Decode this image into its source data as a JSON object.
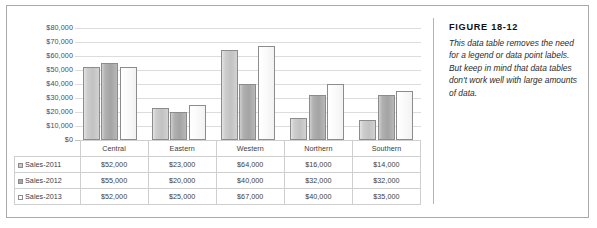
{
  "caption": {
    "figure_number": "FIGURE 18-12",
    "text": "This data table removes the need for a legend or data point labels. But keep in mind that data tables don't work well with large amounts of data."
  },
  "chart_data": {
    "type": "bar",
    "title": "",
    "xlabel": "",
    "ylabel": "",
    "grid": true,
    "legend_position": "data-table",
    "ylim": [
      0,
      80000
    ],
    "ytick_labels": [
      "$80,000",
      "$70,000",
      "$60,000",
      "$50,000",
      "$40,000",
      "$30,000",
      "$20,000",
      "$10,000",
      "$0"
    ],
    "ytick_values": [
      80000,
      70000,
      60000,
      50000,
      40000,
      30000,
      20000,
      10000,
      0
    ],
    "categories": [
      "Central",
      "Eastern",
      "Western",
      "Northern",
      "Southern"
    ],
    "series": [
      {
        "name": "Sales-2011",
        "color": "#c9c9c9",
        "values": [
          52000,
          23000,
          64000,
          16000,
          14000
        ],
        "labels": [
          "$52,000",
          "$23,000",
          "$64,000",
          "$16,000",
          "$14,000"
        ]
      },
      {
        "name": "Sales-2012",
        "color": "#a8a8a8",
        "values": [
          55000,
          20000,
          40000,
          32000,
          32000
        ],
        "labels": [
          "$55,000",
          "$20,000",
          "$40,000",
          "$32,000",
          "$32,000"
        ]
      },
      {
        "name": "Sales-2013",
        "color": "#ffffff",
        "values": [
          52000,
          25000,
          67000,
          40000,
          35000
        ],
        "labels": [
          "$52,000",
          "$25,000",
          "$67,000",
          "$40,000",
          "$35,000"
        ]
      }
    ]
  }
}
